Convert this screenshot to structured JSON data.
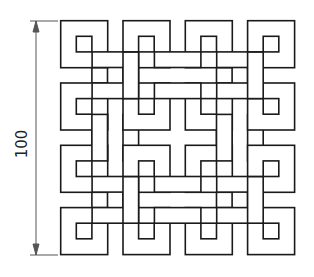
{
  "drawing": {
    "title": "Interlaced square knot pattern",
    "dimension": {
      "value": "100",
      "orientation": "vertical"
    },
    "colors": {
      "line": "#1a1a1a",
      "dimension_line": "#555555",
      "fill": "#ffffff"
    },
    "grid": {
      "rows": 4,
      "cols": 4,
      "box_size": 47,
      "pitch": 62.3,
      "band_width": 15.6,
      "origin_x": 60.7,
      "origin_y": 20.7
    }
  }
}
